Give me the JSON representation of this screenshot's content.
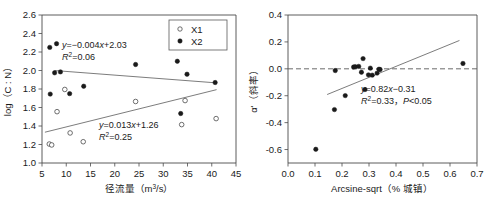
{
  "figure": {
    "panel_count": 2
  },
  "chart_data": [
    {
      "id": "left",
      "type": "scatter",
      "title": "",
      "xlabel": "径流量（m³/s）",
      "xlabel_parts": {
        "main": "径流量（m",
        "sup": "3",
        "tail": "/s）"
      },
      "ylabel": "log（C : N）",
      "xlim": [
        5,
        45
      ],
      "ylim": [
        1.0,
        2.6
      ],
      "xticks": [
        "5",
        "10",
        "15",
        "20",
        "25",
        "30",
        "35",
        "40",
        "45"
      ],
      "xtick_values": [
        5,
        10,
        15,
        20,
        25,
        30,
        35,
        40,
        45
      ],
      "yticks": [
        "1.0",
        "1.2",
        "1.4",
        "1.6",
        "1.8",
        "2.0",
        "2.2",
        "2.4",
        "2.6"
      ],
      "ytick_values": [
        1.0,
        1.2,
        1.4,
        1.6,
        1.8,
        2.0,
        2.2,
        2.4,
        2.6
      ],
      "grid": false,
      "legend_position": "top-right",
      "legend": [
        {
          "label": "X1",
          "marker": "open-circle"
        },
        {
          "label": "X2",
          "marker": "filled-circle"
        }
      ],
      "series": [
        {
          "name": "X2",
          "marker": "filled-circle",
          "points": [
            [
              6.6,
              2.25
            ],
            [
              6.7,
              1.745
            ],
            [
              7.6,
              1.975
            ],
            [
              8.0,
              2.29
            ],
            [
              8.8,
              1.985
            ],
            [
              10.7,
              1.75
            ],
            [
              13.6,
              1.83
            ],
            [
              24.3,
              2.065
            ],
            [
              32.8,
              2.34
            ],
            [
              32.9,
              2.1
            ],
            [
              33.6,
              1.535
            ],
            [
              34.9,
              1.96
            ],
            [
              40.7,
              1.87
            ]
          ]
        },
        {
          "name": "X1",
          "marker": "open-circle",
          "points": [
            [
              6.5,
              1.205
            ],
            [
              7.0,
              1.195
            ],
            [
              8.1,
              1.555
            ],
            [
              9.7,
              1.795
            ],
            [
              10.8,
              1.325
            ],
            [
              13.5,
              1.23
            ],
            [
              24.3,
              1.665
            ],
            [
              33.8,
              1.415
            ],
            [
              34.5,
              1.675
            ],
            [
              40.9,
              1.48
            ]
          ]
        }
      ],
      "fits": [
        {
          "for": "X2",
          "equation": "y=−0.004x+2.03",
          "eq_lhs": "y",
          "eq_rhs": "=−0.004",
          "eq_var": "x",
          "eq_tail": "+2.03",
          "r2_label": "R",
          "r2_sup": "2",
          "r2_value": "=0.06",
          "slope": -0.004,
          "intercept": 2.03,
          "r2": 0.06,
          "x_from": 7.6,
          "x_to": 41.0
        },
        {
          "for": "X1",
          "equation": "y=0.013x+1.26",
          "eq_lhs": "y",
          "eq_rhs": "=0.013",
          "eq_var": "x",
          "eq_tail": "+1.26",
          "r2_label": "R",
          "r2_sup": "2",
          "r2_value": "=0.25",
          "slope": 0.013,
          "intercept": 1.26,
          "r2": 0.25,
          "x_from": 5.6,
          "x_to": 41.0
        }
      ]
    },
    {
      "id": "right",
      "type": "scatter",
      "title": "",
      "xlabel": "Arcsine-sqrt（% 城镇）",
      "ylabel": "α'（斜率）",
      "xlim": [
        0.0,
        0.7
      ],
      "ylim": [
        -0.7,
        0.4
      ],
      "xticks": [
        "0.0",
        "0.1",
        "0.2",
        "0.3",
        "0.4",
        "0.5",
        "0.6",
        "0.7"
      ],
      "xtick_values": [
        0.0,
        0.1,
        0.2,
        0.3,
        0.4,
        0.5,
        0.6,
        0.7
      ],
      "yticks": [
        "-0.6",
        "-0.4",
        "-0.2",
        "0.0",
        "0.2",
        "0.4"
      ],
      "ytick_values": [
        -0.6,
        -0.4,
        -0.2,
        0.0,
        0.2,
        0.4
      ],
      "grid": false,
      "reference_line": {
        "y": 0.0,
        "style": "dashed"
      },
      "legend_position": "none",
      "series": [
        {
          "name": "alpha",
          "marker": "filled-circle",
          "points": [
            [
              0.103,
              -0.598
            ],
            [
              0.172,
              -0.303
            ],
            [
              0.175,
              -0.013
            ],
            [
              0.212,
              -0.199
            ],
            [
              0.243,
              0.013
            ],
            [
              0.249,
              0.016
            ],
            [
              0.262,
              0.018
            ],
            [
              0.272,
              -0.025
            ],
            [
              0.278,
              0.076
            ],
            [
              0.285,
              -0.154
            ],
            [
              0.298,
              -0.045
            ],
            [
              0.305,
              0.005
            ],
            [
              0.312,
              -0.047
            ],
            [
              0.33,
              -0.032
            ],
            [
              0.337,
              -0.003
            ],
            [
              0.341,
              -0.005
            ],
            [
              0.648,
              0.04
            ]
          ]
        }
      ],
      "fits": [
        {
          "for": "alpha",
          "equation": "y=0.82x−0.31",
          "eq_lhs": "y",
          "eq_rhs": "=0.82",
          "eq_var": "x",
          "eq_tail": "−0.31",
          "r2_label": "R",
          "r2_sup": "2",
          "r2_value": "=0.33，",
          "p_label": "P",
          "p_value": "<0.05",
          "slope": 0.82,
          "intercept": -0.31,
          "r2": 0.33,
          "p": "<0.05",
          "x_from": 0.145,
          "x_to": 0.635
        }
      ]
    }
  ]
}
